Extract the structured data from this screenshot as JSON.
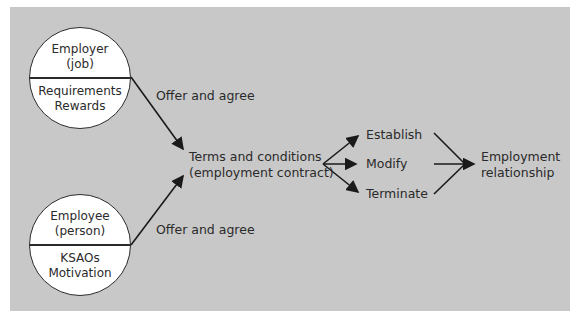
{
  "diagram": {
    "background_color": "#c8c8c8",
    "employer": {
      "title_line1": "Employer",
      "title_line2": "(job)",
      "attr_line1": "Requirements",
      "attr_line2": "Rewards"
    },
    "employee": {
      "title_line1": "Employee",
      "title_line2": "(person)",
      "attr_line1": "KSAOs",
      "attr_line2": "Motivation"
    },
    "offer_top": "Offer and agree",
    "offer_bottom": "Offer and agree",
    "terms_line1": "Terms and conditions",
    "terms_line2": "(employment contract)",
    "actions": [
      "Establish",
      "Modify",
      "Terminate"
    ],
    "result_line1": "Employment",
    "result_line2": "relationship"
  }
}
